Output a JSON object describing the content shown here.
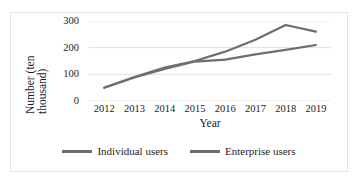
{
  "chart_data": {
    "type": "line",
    "title": "",
    "xlabel": "Year",
    "ylabel": "Number (ten thousand)",
    "ylabel_line1": "Number (ten",
    "ylabel_line2": "thousand)",
    "categories": [
      "2012",
      "2013",
      "2014",
      "2015",
      "2016",
      "2017",
      "2018",
      "2019"
    ],
    "yticks": [
      "300",
      "200",
      "100",
      "0"
    ],
    "ytick_values": [
      300,
      200,
      100,
      0
    ],
    "ylim": [
      0,
      300
    ],
    "grid": true,
    "legend_position": "bottom",
    "series": [
      {
        "name": "Individual users",
        "color": "#6e6e6e",
        "values": [
          50,
          90,
          125,
          150,
          185,
          230,
          285,
          260
        ]
      },
      {
        "name": "Enterprise users",
        "color": "#6e6e6e",
        "values": [
          50,
          88,
          120,
          148,
          155,
          175,
          192,
          210
        ]
      }
    ]
  }
}
